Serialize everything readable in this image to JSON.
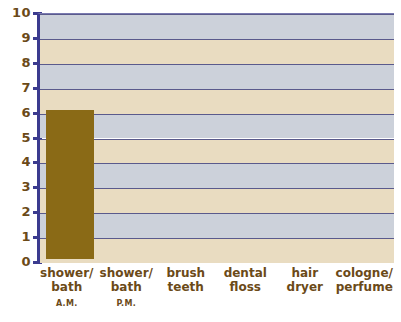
{
  "chart_data": {
    "type": "bar",
    "title": "",
    "subtitle": "",
    "xlabel": "",
    "ylabel": "",
    "ylim": [
      0,
      10
    ],
    "ytick_labels": [
      "10",
      "9",
      "8",
      "7",
      "6",
      "5",
      "4",
      "3",
      "2",
      "1",
      "0"
    ],
    "ytick_values": [
      10,
      9,
      8,
      7,
      6,
      5,
      4,
      3,
      2,
      1,
      0
    ],
    "grid": true,
    "legend": "none",
    "categories": [
      "shower/ bath",
      "shower/ bath",
      "brush teeth",
      "dental floss",
      "hair dryer",
      "cologne/ perfume"
    ],
    "category_lines": [
      [
        "shower/",
        "bath"
      ],
      [
        "shower/",
        "bath"
      ],
      [
        "brush",
        "teeth"
      ],
      [
        "dental",
        "floss"
      ],
      [
        "hair",
        "dryer"
      ],
      [
        "cologne/",
        "perfume"
      ]
    ],
    "category_sublabels": [
      "A.M.",
      "P.M.",
      "",
      "",
      "",
      ""
    ],
    "values": [
      6,
      0,
      0,
      0,
      0,
      0
    ]
  },
  "colors": {
    "bar": "#8a6a16",
    "band_gray": "#ccd1da",
    "band_tan": "#e9dcc1",
    "axis": "#3b3b8f",
    "gridline": "#5a5a8c",
    "text": "#6b4a18",
    "background": "#ffffff"
  }
}
